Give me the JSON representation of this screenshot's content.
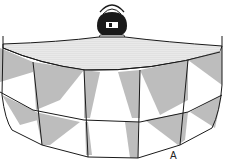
{
  "figure": {
    "label": "A",
    "colors": {
      "line": "#1a1a1a",
      "shade": "#bdbdbd",
      "stipple": "#9a9a9a",
      "background": "#ffffff"
    }
  }
}
